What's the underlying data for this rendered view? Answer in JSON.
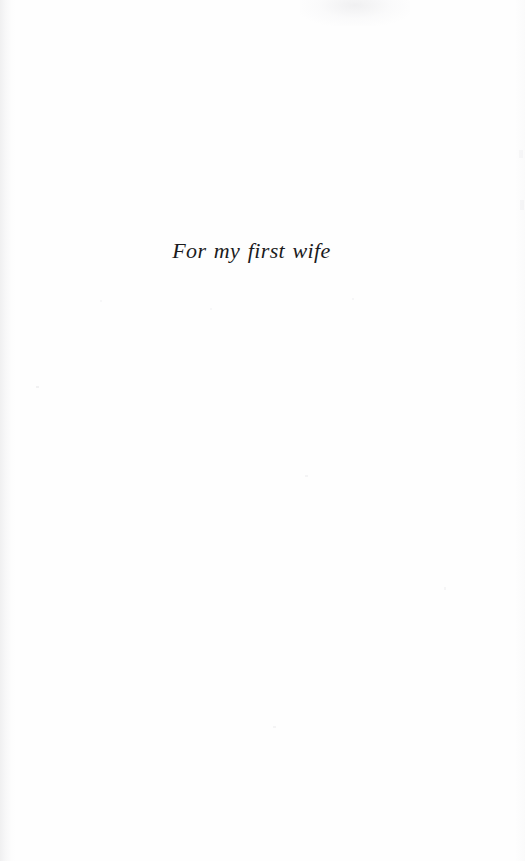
{
  "page": {
    "kind": "book-dedication-page",
    "width": 525,
    "height": 861,
    "background_color": "#fefefe",
    "text_color": "#1b1b1d"
  },
  "dedication": {
    "text": "For my first wife",
    "style": "italic-serif",
    "alignment": "center"
  },
  "artifacts": {
    "gutter_left": "scan-shadow-left-edge",
    "gutter_right": "scan-shadow-right-edge",
    "smudge_top": "scan-smudge-top",
    "noise_bottom": "scan-speckle-bottom-edge"
  }
}
